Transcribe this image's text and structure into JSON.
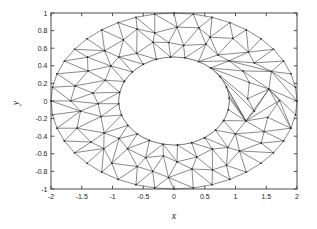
{
  "figure": {
    "background": "#ffffff",
    "axes_color": "#3c3c3c",
    "mesh_color": "#4a4a4a",
    "node_color": "#2b2b2b"
  },
  "chart_data": {
    "type": "scatter",
    "title": "",
    "xlabel": "x",
    "ylabel": "y",
    "xlim": [
      -2,
      2
    ],
    "ylim": [
      -1,
      1
    ],
    "grid": false,
    "legend": null,
    "xticks": [
      -2,
      -1.5,
      -1,
      -0.5,
      0,
      0.5,
      1,
      1.5,
      2
    ],
    "xticklabels": [
      "-2",
      "-1.5",
      "-1",
      "-0.5",
      "0",
      "0.5",
      "1",
      "1.5",
      "2"
    ],
    "yticks": [
      1,
      0.8,
      0.6,
      0.4,
      0.2,
      0,
      -0.2,
      -0.4,
      -0.6,
      -0.8,
      -1
    ],
    "yticklabels": [
      "1",
      "0.8",
      "0.6",
      "0.4",
      "0.2",
      "0",
      "-0.2",
      "-0.4",
      "-0.6",
      "-0.8",
      "-1"
    ],
    "geometry": {
      "outer_ellipse": {
        "cx": 0,
        "cy": 0,
        "a": 2.0,
        "b": 1.0
      },
      "inner_ellipse": {
        "cx": 0,
        "cy": 0,
        "a": 0.9,
        "b": 0.5
      },
      "outer_boundary_nodes": 40,
      "inner_boundary_nodes": 24,
      "mesh_rings": 3,
      "mesh_layers": [
        {
          "ring": 0,
          "scale": 1.0,
          "nodes": 40
        },
        {
          "ring": 1,
          "scale": 0.72,
          "nodes": 32
        },
        {
          "ring": 2,
          "scale": 0.45,
          "nodes": 28
        },
        {
          "ring": 3,
          "scale": 0.0,
          "nodes": 24
        }
      ]
    }
  }
}
